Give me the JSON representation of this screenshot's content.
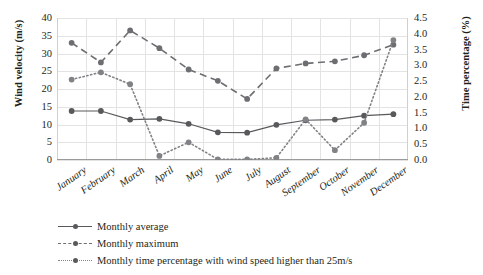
{
  "chart_data": {
    "type": "line",
    "title": "",
    "xlabel": "",
    "ylabel": "Wind velocity (m/s)",
    "y2label": "Time percentage (%)",
    "categories": [
      "January",
      "February",
      "March",
      "April",
      "May",
      "June",
      "July",
      "August",
      "September",
      "October",
      "November",
      "December"
    ],
    "ylim": [
      0,
      40
    ],
    "yticks": [
      "0",
      "5",
      "10",
      "15",
      "20",
      "25",
      "30",
      "35",
      "40"
    ],
    "y2lim": [
      0,
      4.5
    ],
    "y2ticks": [
      "0.0",
      "0.5",
      "1.0",
      "1.5",
      "2.0",
      "2.5",
      "3.0",
      "3.5",
      "4.0",
      "4.5"
    ],
    "grid": true,
    "legend_position": "bottom-left",
    "series": [
      {
        "name": "Monthly average",
        "axis": "left",
        "style": "solid",
        "marker": "circle",
        "color": "#58595b",
        "values": [
          13.8,
          13.8,
          11.4,
          11.6,
          10.2,
          7.8,
          7.7,
          9.9,
          11.2,
          11.4,
          12.5,
          12.9
        ]
      },
      {
        "name": "Monthly maximum",
        "axis": "left",
        "style": "dashed",
        "marker": "circle",
        "color": "#6d6e71",
        "values": [
          33.0,
          27.5,
          36.5,
          31.5,
          25.5,
          22.3,
          17.2,
          25.8,
          27.2,
          27.8,
          29.5,
          32.5
        ]
      },
      {
        "name": "Monthly time percentage with wind speed higher than 25m/s",
        "axis": "right",
        "style": "dotted",
        "marker": "circle",
        "color": "#808285",
        "values": [
          2.55,
          2.78,
          2.4,
          0.13,
          0.56,
          0.02,
          0.02,
          0.07,
          1.29,
          0.31,
          1.18,
          3.8
        ]
      }
    ]
  },
  "axes": {
    "left_title": "Wind velocity (m/s)",
    "right_title": "Time percentage (%)",
    "left_ticks": [
      "40",
      "35",
      "30",
      "25",
      "20",
      "15",
      "10",
      "5",
      "0"
    ],
    "right_ticks": [
      "4.5",
      "4.0",
      "3.5",
      "3.0",
      "2.5",
      "2.0",
      "1.5",
      "1.0",
      "0.5",
      "0.0"
    ],
    "x_categories": [
      "January",
      "February",
      "March",
      "April",
      "May",
      "June",
      "July",
      "August",
      "September",
      "October",
      "November",
      "December"
    ]
  },
  "legend": {
    "items": [
      {
        "label": "Monthly average"
      },
      {
        "label": "Monthly maximum"
      },
      {
        "label": "Monthly time percentage with wind speed higher than 25m/s"
      }
    ]
  }
}
